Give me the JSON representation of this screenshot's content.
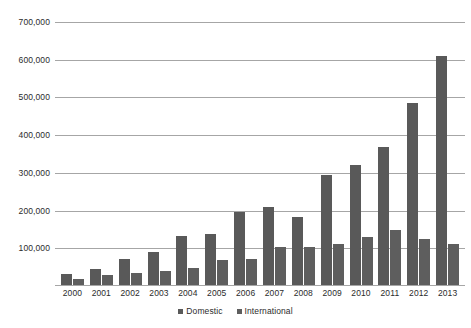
{
  "chart_data": {
    "type": "bar",
    "title": "",
    "xlabel": "",
    "ylabel": "",
    "ylim": [
      0,
      700000
    ],
    "grid": true,
    "legend_position": "bottom-center",
    "categories": [
      "2000",
      "2001",
      "2002",
      "2003",
      "2004",
      "2005",
      "2006",
      "2007",
      "2008",
      "2009",
      "2010",
      "2011",
      "2012",
      "2013"
    ],
    "series": [
      {
        "name": "Domestic",
        "color": "#595959",
        "values": [
          28000,
          42000,
          68000,
          88000,
          130000,
          135000,
          193000,
          207000,
          180000,
          293000,
          317000,
          367000,
          482000,
          606000
        ]
      },
      {
        "name": "International",
        "color": "#5e5e5e",
        "values": [
          15000,
          27000,
          33000,
          38000,
          46000,
          66000,
          68000,
          100000,
          100000,
          108000,
          128000,
          147000,
          121000,
          110000
        ]
      }
    ],
    "ytick_labels": [
      "100,000",
      "200,000",
      "300,000",
      "400,000",
      "500,000",
      "600,000",
      "700,000"
    ],
    "ytick_values": [
      100000,
      200000,
      300000,
      400000,
      500000,
      600000,
      700000
    ]
  },
  "legend": {
    "items": [
      {
        "label": "Domestic",
        "marker": "square-marker-icon"
      },
      {
        "label": "International",
        "marker": "square-marker-icon"
      }
    ]
  }
}
